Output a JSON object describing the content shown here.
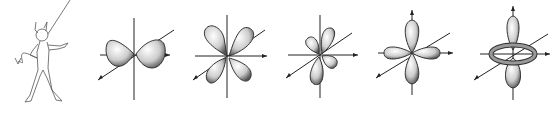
{
  "illustration": {
    "background": "#ffffff",
    "ink_color": "#222222",
    "figures": [
      {
        "id": "devil",
        "label": "cartoon devil with pointer"
      },
      {
        "id": "orbital-1",
        "label": "d-orbital dxy-type (two lobes along x with diagonal axis)"
      },
      {
        "id": "orbital-2",
        "label": "d-orbital four-lobe cloverleaf (diagonal)"
      },
      {
        "id": "orbital-3",
        "label": "d-orbital four-lobe cloverleaf (tilted)"
      },
      {
        "id": "orbital-4",
        "label": "d-orbital four-lobe along axes"
      },
      {
        "id": "orbital-5",
        "label": "dz2 orbital with torus"
      }
    ]
  }
}
